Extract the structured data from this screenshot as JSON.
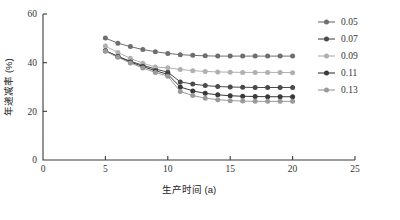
{
  "chart_data": {
    "type": "line",
    "title": "",
    "xlabel": "生产时间 (a)",
    "ylabel": "年递减率 (%)",
    "xlim": [
      0,
      25
    ],
    "ylim": [
      0,
      60
    ],
    "xticks": [
      0,
      5,
      10,
      15,
      20,
      25
    ],
    "yticks": [
      0,
      20,
      40,
      60
    ],
    "xtick_labels": [
      "0",
      "5",
      "10",
      "15",
      "20",
      "25"
    ],
    "ytick_labels": [
      "0",
      "20",
      "40",
      "60"
    ],
    "grid": false,
    "legend_position": "right",
    "x": [
      5,
      6,
      7,
      8,
      9,
      10,
      11,
      12,
      13,
      14,
      15,
      16,
      17,
      18,
      19,
      20
    ],
    "series": [
      {
        "name": "0.05",
        "color": "#6e6e6e",
        "values": [
          50.1,
          48.0,
          46.6,
          45.4,
          44.5,
          43.8,
          43.3,
          43.0,
          42.8,
          42.7,
          42.7,
          42.7,
          42.7,
          42.7,
          42.7,
          42.7
        ]
      },
      {
        "name": "0.07",
        "color": "#4a4a4a",
        "values": [
          44.9,
          42.6,
          40.6,
          38.9,
          37.4,
          36.1,
          32.1,
          31.2,
          30.6,
          30.2,
          30.0,
          29.9,
          29.8,
          29.8,
          29.8,
          29.8
        ]
      },
      {
        "name": "0.09",
        "color": "#b0b0b0",
        "values": [
          46.8,
          44.2,
          41.8,
          39.8,
          38.2,
          37.9,
          37.2,
          36.7,
          36.4,
          36.2,
          36.1,
          36.0,
          36.0,
          36.0,
          36.0,
          35.9
        ]
      },
      {
        "name": "0.11",
        "color": "#3a3a3a",
        "values": [
          44.9,
          42.5,
          40.3,
          38.4,
          36.7,
          35.2,
          30.0,
          28.4,
          27.4,
          26.8,
          26.4,
          26.2,
          26.1,
          26.0,
          26.0,
          26.0
        ]
      },
      {
        "name": "0.13",
        "color": "#9a9a9a",
        "values": [
          44.7,
          42.2,
          39.9,
          37.8,
          36.0,
          34.4,
          28.2,
          26.5,
          25.4,
          24.8,
          24.4,
          24.2,
          24.1,
          24.1,
          24.1,
          24.1
        ]
      }
    ]
  },
  "legend": {
    "items": [
      {
        "label": "0.05"
      },
      {
        "label": "0.07"
      },
      {
        "label": "0.09"
      },
      {
        "label": "0.11"
      },
      {
        "label": "0.13"
      }
    ]
  },
  "axes": {
    "x_title": "生产时间 (a)",
    "y_title": "年递减率 (%)"
  }
}
